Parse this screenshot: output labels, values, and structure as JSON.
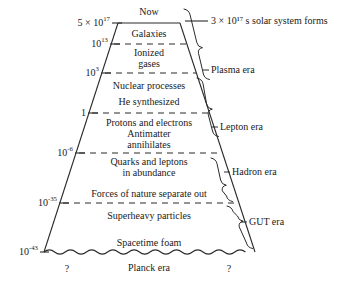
{
  "figure": {
    "type": "cosmology-timeline-diagram",
    "shape": "trapezoid"
  },
  "top": {
    "now_label": "Now",
    "solar_note": "3 × 10¹⁷ s solar system forms"
  },
  "axis": {
    "unit": "seconds",
    "ticks": [
      {
        "label": "5 × 10¹⁷",
        "mantissa": "5 × 10",
        "exponent": "17",
        "y": 23
      },
      {
        "label": "10¹³",
        "mantissa": "10",
        "exponent": "13",
        "y": 44
      },
      {
        "label": "10³",
        "mantissa": "10",
        "exponent": "3",
        "y": 73
      },
      {
        "label": "1",
        "mantissa": "1",
        "exponent": "",
        "y": 113
      },
      {
        "label": "10⁻⁶",
        "mantissa": "10",
        "exponent": "-6",
        "y": 153
      },
      {
        "label": "10⁻³⁵",
        "mantissa": "10",
        "exponent": "-35",
        "y": 203
      },
      {
        "label": "10⁻⁴³",
        "mantissa": "10",
        "exponent": "-43",
        "y": 252
      }
    ]
  },
  "events": [
    {
      "label": "Galaxies",
      "y": 34
    },
    {
      "label": "Ionized",
      "label2": "gases",
      "y": 58
    },
    {
      "label": "Nuclear processes",
      "y": 86
    },
    {
      "label": "He synthesized",
      "y": 102
    },
    {
      "label": "Protons and electrons",
      "y": 123
    },
    {
      "label": "Antimatter",
      "label2": "annihilates",
      "y": 139
    },
    {
      "label": "Quarks and leptons",
      "label2": "in abundance",
      "y": 167
    },
    {
      "label": "Forces of nature separate out",
      "y": 194
    },
    {
      "label": "Superheavy particles",
      "y": 216
    },
    {
      "label": "Spacetime foam",
      "y": 243
    },
    {
      "label": "Planck era",
      "y": 268
    }
  ],
  "eras": [
    {
      "label": "Plasma era",
      "y": 70
    },
    {
      "label": "Lepton era",
      "y": 127
    },
    {
      "label": "Hadron era",
      "y": 172
    },
    {
      "label": "GUT era",
      "y": 222
    }
  ],
  "questions": [
    {
      "label": "?",
      "x": 67,
      "y": 269
    },
    {
      "label": "?",
      "x": 229,
      "y": 269
    }
  ],
  "colors": {
    "ink": "#1a1a1a",
    "background": "#ffffff",
    "rule": "#2a2a2a"
  }
}
